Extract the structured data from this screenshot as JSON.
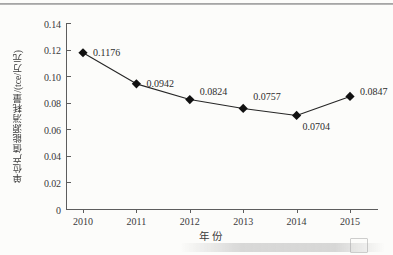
{
  "chart_data": {
    "type": "line",
    "title": "",
    "subtitle": "",
    "xlabel": "年 份",
    "ylabel": "单位产值能源消耗量/(tce/万元)",
    "categories": [
      "2010",
      "2011",
      "2012",
      "2013",
      "2014",
      "2015"
    ],
    "values": [
      0.1176,
      0.0942,
      0.0824,
      0.0757,
      0.0704,
      0.0847
    ],
    "point_labels": [
      "0.1176",
      "0.0942",
      "0.0824",
      "0.0757",
      "0.0704",
      "0.0847"
    ],
    "ylim": [
      0,
      0.14
    ],
    "xlim": [
      2009.5,
      2015.6
    ],
    "ytick_labels": [
      "0",
      "0.02",
      "0.04",
      "0.06",
      "0.08",
      "0.10",
      "0.12",
      "0.14"
    ],
    "ytick_values": [
      0,
      0.02,
      0.04,
      0.06,
      0.08,
      0.1,
      0.12,
      0.14
    ],
    "xtick_labels": [
      "2010",
      "2011",
      "2012",
      "2013",
      "2014",
      "2015"
    ],
    "grid": false,
    "legend": null,
    "marker": "filled-diamond",
    "line_color": "#262626",
    "marker_color": "#111111",
    "axis_color": "#5d5d5d",
    "background_color": "#fcfcfa",
    "label_offsets": [
      {
        "dx": 10,
        "dy": -1
      },
      {
        "dx": 10,
        "dy": -1
      },
      {
        "dx": 10,
        "dy": -9
      },
      {
        "dx": 10,
        "dy": -12
      },
      {
        "dx": 6,
        "dy": 11
      },
      {
        "dx": 10,
        "dy": -5
      }
    ]
  }
}
